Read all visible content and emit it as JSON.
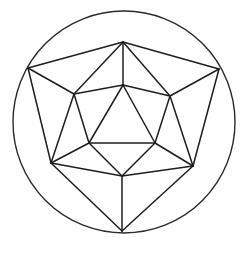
{
  "figure": {
    "stroke_color": "#1e1e1e",
    "background": "#ffffff",
    "circle": {
      "cx": 124,
      "cy": 122,
      "r": 111
    },
    "vertices": {
      "T": [
        123,
        42
      ],
      "UL": [
        28,
        68
      ],
      "UR": [
        219,
        69
      ],
      "LL": [
        51,
        163
      ],
      "LR": [
        193,
        166
      ],
      "B": [
        122,
        231
      ],
      "MT": [
        123,
        85
      ],
      "ML": [
        74,
        94
      ],
      "MR": [
        170,
        96
      ],
      "IBL": [
        89,
        143
      ],
      "IBR": [
        155,
        143
      ],
      "MB": [
        122,
        176
      ]
    },
    "edges": [
      [
        "T",
        "UL"
      ],
      [
        "T",
        "UR"
      ],
      [
        "UL",
        "LL"
      ],
      [
        "UR",
        "LR"
      ],
      [
        "LL",
        "B"
      ],
      [
        "LR",
        "B"
      ],
      [
        "T",
        "MT"
      ],
      [
        "T",
        "ML"
      ],
      [
        "T",
        "MR"
      ],
      [
        "UL",
        "ML"
      ],
      [
        "UR",
        "MR"
      ],
      [
        "LL",
        "ML"
      ],
      [
        "LL",
        "IBL"
      ],
      [
        "LL",
        "MB"
      ],
      [
        "LR",
        "MR"
      ],
      [
        "LR",
        "IBR"
      ],
      [
        "LR",
        "MB"
      ],
      [
        "MB",
        "B"
      ],
      [
        "MT",
        "ML"
      ],
      [
        "MT",
        "MR"
      ],
      [
        "ML",
        "IBL"
      ],
      [
        "MR",
        "IBR"
      ],
      [
        "IBL",
        "MB"
      ],
      [
        "IBR",
        "MB"
      ],
      [
        "MT",
        "IBL"
      ],
      [
        "MT",
        "IBR"
      ],
      [
        "IBL",
        "IBR"
      ]
    ]
  }
}
